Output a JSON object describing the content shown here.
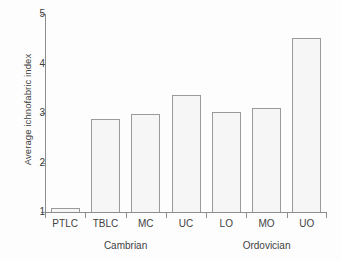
{
  "chart_data": {
    "type": "bar",
    "title": "",
    "xlabel": "",
    "ylabel": "Average ichnofabric index",
    "ylim": [
      1,
      5
    ],
    "yticks": [
      1,
      2,
      3,
      4,
      5
    ],
    "ytick_labels": [
      "1",
      "2",
      "3",
      "4",
      "5"
    ],
    "grid": false,
    "legend": null,
    "categories": [
      "PTLC",
      "TBLC",
      "MC",
      "UC",
      "LO",
      "MO",
      "UO"
    ],
    "values": [
      1.08,
      2.88,
      2.98,
      3.36,
      3.03,
      3.11,
      4.51
    ],
    "bar_fill": "#f6f6f6",
    "bar_edge": "#9a9a9a",
    "axis_color": "#8d8d8d",
    "groups": [
      {
        "label": "Cambrian",
        "categories": [
          "PTLC",
          "TBLC",
          "MC",
          "UC"
        ]
      },
      {
        "label": "Ordovician",
        "categories": [
          "LO",
          "MO",
          "UO"
        ]
      }
    ]
  }
}
